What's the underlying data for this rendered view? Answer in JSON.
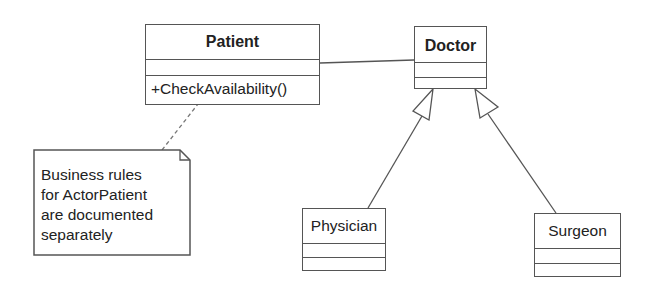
{
  "diagram": {
    "type": "uml-class-diagram",
    "classes": [
      {
        "id": "patient",
        "name": "Patient",
        "bold": true,
        "attributes": [],
        "operations": [
          "+CheckAvailability()"
        ]
      },
      {
        "id": "doctor",
        "name": "Doctor",
        "bold": true,
        "attributes": [],
        "operations": []
      },
      {
        "id": "physician",
        "name": "Physician",
        "bold": false,
        "attributes": [],
        "operations": []
      },
      {
        "id": "surgeon",
        "name": "Surgeon",
        "bold": false,
        "attributes": [],
        "operations": []
      }
    ],
    "note": {
      "lines": [
        "Business rules",
        "for ActorPatient",
        "are documented",
        "separately"
      ],
      "attached_to": "patient"
    },
    "relationships": [
      {
        "type": "association",
        "from": "patient",
        "to": "doctor"
      },
      {
        "type": "generalization",
        "from": "physician",
        "to": "doctor"
      },
      {
        "type": "generalization",
        "from": "surgeon",
        "to": "doctor"
      },
      {
        "type": "note-anchor",
        "from": "note",
        "to": "patient"
      }
    ],
    "colors": {
      "line": "#555555",
      "fill": "#ffffff",
      "text": "#222222"
    }
  }
}
